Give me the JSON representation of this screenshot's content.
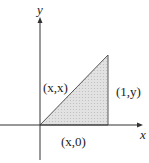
{
  "diagram": {
    "axes": {
      "x_label": "x",
      "y_label": "y"
    },
    "region": {
      "shape": "triangle",
      "fill": "#d9d9d9",
      "stroke": "#555555"
    },
    "labels": {
      "hypotenuse_point": "(x,x)",
      "right_edge_point": "(1,y)",
      "base_point": "(x,0)"
    },
    "colors": {
      "axis": "#333333",
      "text": "#222222"
    }
  }
}
